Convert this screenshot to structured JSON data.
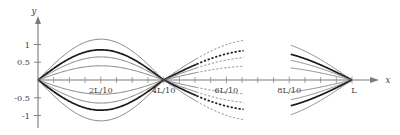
{
  "figure": {
    "title": "",
    "axes": {
      "x_axis_label": "x",
      "y_axis_label": "y",
      "x_ticks_labeled": [
        {
          "value": 0.2,
          "label": "2L/10"
        },
        {
          "value": 0.4,
          "label": "4L/10"
        },
        {
          "value": 0.6,
          "label": "6L/10"
        },
        {
          "value": 0.8,
          "label": "8L/10"
        },
        {
          "value": 1.0,
          "label": "L"
        }
      ],
      "y_ticks_labeled": [
        {
          "value": 1,
          "label": "1"
        },
        {
          "value": 0.5,
          "label": "0.5"
        },
        {
          "value": -0.5,
          "label": "-0.5"
        },
        {
          "value": -1,
          "label": "-1"
        }
      ],
      "x_minor_tick_count": 20,
      "xlim": [
        0,
        1.08
      ],
      "ylim": [
        -1.25,
        1.25
      ],
      "grid": false
    }
  },
  "chart_data": {
    "type": "line",
    "title": "",
    "xlabel": "x",
    "ylabel": "y",
    "xlim": [
      0,
      1.08
    ],
    "ylim": [
      -1.25,
      1.25
    ],
    "grid": false,
    "legend": "none",
    "x_tick_labels": [
      "2L/10",
      "4L/10",
      "6L/10",
      "8L/10",
      "L"
    ],
    "x_tick_values": [
      0.2,
      0.4,
      0.6,
      0.8,
      1.0
    ],
    "y_tick_labels": [
      "1",
      "0.5",
      "-0.5",
      "-1"
    ],
    "y_tick_values": [
      1,
      0.5,
      -0.5,
      -1
    ],
    "node_positions": [
      0.0,
      0.4,
      1.0
    ],
    "series": [
      {
        "name": "envelope-upper",
        "amplitude": 1.15,
        "style": "solid-thin",
        "sign": 1
      },
      {
        "name": "mode-bold",
        "amplitude": 0.85,
        "style": "solid-bold",
        "sign": 1
      },
      {
        "name": "mid-upper",
        "amplitude": 0.65,
        "style": "solid-thin",
        "sign": 1
      },
      {
        "name": "low-upper",
        "amplitude": 0.4,
        "style": "solid-thin",
        "sign": 1
      },
      {
        "name": "low-lower",
        "amplitude": 0.4,
        "style": "solid-thin",
        "sign": -1
      },
      {
        "name": "mid-lower",
        "amplitude": 0.65,
        "style": "solid-thin",
        "sign": -1
      },
      {
        "name": "mode-bold-neg",
        "amplitude": 0.85,
        "style": "solid-bold",
        "sign": -1
      },
      {
        "name": "envelope-lower",
        "amplitude": 1.15,
        "style": "solid-thin",
        "sign": -1
      }
    ],
    "sampled_points": {
      "x": [
        0,
        0.05,
        0.1,
        0.15,
        0.2,
        0.25,
        0.3,
        0.35,
        0.4,
        0.45,
        0.5,
        0.55,
        0.6,
        0.65,
        0.7,
        0.75,
        0.8,
        0.85,
        0.9,
        0.95,
        1.0
      ],
      "envelope_upper_y": [
        0,
        0.44,
        0.81,
        1.06,
        1.15,
        1.06,
        0.81,
        0.44,
        0,
        0.33,
        0.63,
        0.87,
        1.04,
        1.13,
        1.15,
        1.09,
        0.96,
        0.78,
        0.55,
        0.29,
        0
      ],
      "mode_bold_y": [
        0,
        0.33,
        0.6,
        0.79,
        0.85,
        0.79,
        0.6,
        0.33,
        0,
        0.24,
        0.47,
        0.64,
        0.77,
        0.83,
        0.85,
        0.8,
        0.71,
        0.58,
        0.41,
        0.21,
        0
      ],
      "mid_upper_y": [
        0,
        0.25,
        0.46,
        0.6,
        0.65,
        0.6,
        0.46,
        0.25,
        0,
        0.19,
        0.36,
        0.49,
        0.59,
        0.64,
        0.65,
        0.62,
        0.54,
        0.44,
        0.31,
        0.16,
        0
      ],
      "low_upper_y": [
        0,
        0.15,
        0.28,
        0.37,
        0.4,
        0.37,
        0.28,
        0.15,
        0,
        0.11,
        0.22,
        0.3,
        0.36,
        0.39,
        0.4,
        0.38,
        0.33,
        0.27,
        0.19,
        0.1,
        0
      ]
    }
  },
  "labels": {
    "y_axis": "y",
    "x_axis": "x",
    "y1": "1",
    "y05": "0.5",
    "ym05": "-0.5",
    "ym1": "-1",
    "t2": "2L/10",
    "t4": "4L/10",
    "t6": "6L/10",
    "t8": "8L/10",
    "tL": "L"
  },
  "colors": {
    "background": "#ffffff",
    "axis": "#7a7a7a",
    "curve_thin": "#6f6f6f",
    "curve_bold": "#1a1a1a",
    "text": "#3c3c3c"
  }
}
